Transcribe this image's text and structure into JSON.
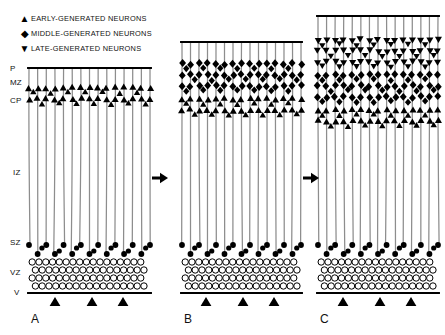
{
  "figure": {
    "background": "#ffffff",
    "ink": "#000000",
    "fiber_color": "#8d8d8d"
  },
  "legend": {
    "items": [
      {
        "glyph": "▲",
        "icon": "up-triangle-icon",
        "label": "EARLY-GENERATED NEURONS",
        "color": "#000000"
      },
      {
        "glyph": "◆",
        "icon": "diamond-icon",
        "label": "MIDDLE-GENERATED NEURONS",
        "color": "#000000"
      },
      {
        "glyph": "▼",
        "icon": "down-triangle-icon",
        "label": "LATE-GENERATED NEURONS",
        "color": "#000000"
      }
    ]
  },
  "zone_labels": [
    {
      "key": "P",
      "text": "P",
      "x": 10,
      "y": 64
    },
    {
      "key": "MZ",
      "text": "MZ",
      "x": 10,
      "y": 78
    },
    {
      "key": "CP",
      "text": "CP",
      "x": 10,
      "y": 96
    },
    {
      "key": "IZ",
      "text": "IZ",
      "x": 13,
      "y": 168
    },
    {
      "key": "SZ",
      "text": "SZ",
      "x": 10,
      "y": 238
    },
    {
      "key": "VZ",
      "text": "VZ",
      "x": 10,
      "y": 268
    },
    {
      "key": "V",
      "text": "V",
      "x": 14,
      "y": 288
    }
  ],
  "panels": [
    {
      "id": "A",
      "label": "A",
      "label_x": 31,
      "label_y": 312,
      "x0": 29,
      "x1": 150,
      "pial_y": 68,
      "ventricle_y": 293,
      "fibers": 15,
      "layers": [
        {
          "type": "up-triangle",
          "rows": 2,
          "top_y": 88,
          "row_gap": 11
        }
      ],
      "sz_rows": 2,
      "vz_rows": 4,
      "tick_arrows": [
        55,
        92,
        123
      ]
    },
    {
      "id": "B",
      "label": "B",
      "label_x": 184,
      "label_y": 312,
      "x0": 182,
      "x1": 301,
      "pial_y": 42,
      "ventricle_y": 293,
      "fibers": 15,
      "layers": [
        {
          "type": "diamond",
          "rows": 3,
          "top_y": 64,
          "row_gap": 11
        },
        {
          "type": "up-triangle",
          "rows": 2,
          "top_y": 99,
          "row_gap": 11
        }
      ],
      "sz_rows": 2,
      "vz_rows": 4,
      "tick_arrows": [
        206,
        243,
        274
      ]
    },
    {
      "id": "C",
      "label": "C",
      "label_x": 320,
      "label_y": 312,
      "x0": 318,
      "x1": 438,
      "pial_y": 16,
      "ventricle_y": 293,
      "fibers": 15,
      "layers": [
        {
          "type": "down-triangle",
          "rows": 3,
          "top_y": 40,
          "row_gap": 11
        },
        {
          "type": "diamond",
          "rows": 3,
          "top_y": 75,
          "row_gap": 11
        },
        {
          "type": "up-triangle",
          "rows": 2,
          "top_y": 110,
          "row_gap": 11
        }
      ],
      "sz_rows": 2,
      "vz_rows": 4,
      "tick_arrows": [
        343,
        380,
        411
      ]
    }
  ],
  "flow_arrows": [
    {
      "name": "arrow-a-to-b",
      "x": 152,
      "y": 178
    },
    {
      "name": "arrow-b-to-c",
      "x": 303,
      "y": 178
    }
  ]
}
